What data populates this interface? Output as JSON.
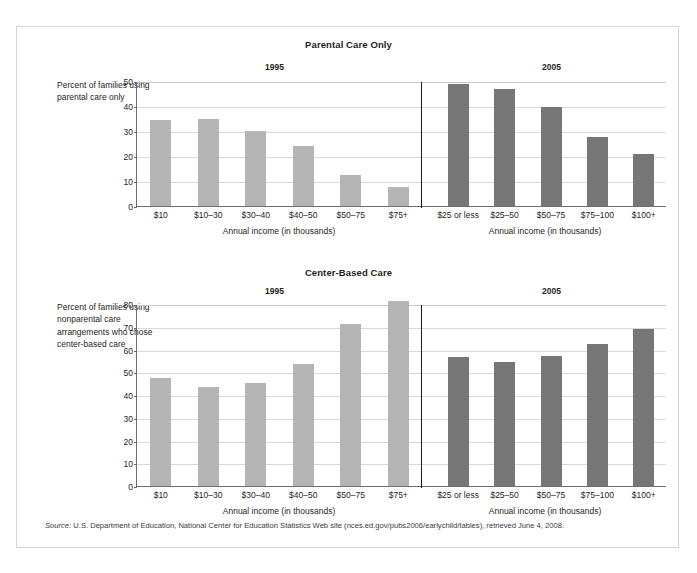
{
  "source_note_prefix": "Source:",
  "source_note": " U.S. Department of Education, National Center for Education Statistics Web site (nces.ed.gov/pubs2006/earlychild/tables), retrieved June 4, 2008.",
  "colors": {
    "bar_1995": "#b4b4b4",
    "bar_2005": "#767676",
    "axis": "#6d6d6d",
    "gridline": "#d9d9d9",
    "divider": "#1a1a1a",
    "frame": "#d4d4d4",
    "text": "#231f20"
  },
  "chart_data": [
    {
      "type": "bar",
      "title": "Parental Care Only",
      "ylabel": "Percent of families using parental care only",
      "ylim": [
        0,
        50
      ],
      "yticks": [
        0,
        10,
        20,
        30,
        40,
        50
      ],
      "grid": true,
      "legend": "none",
      "panels": [
        {
          "name": "1995",
          "xlabel": "Annual income (in thousands)",
          "categories": [
            "$10",
            "$10–30",
            "$30–40",
            "$40–50",
            "$50–75",
            "$75+"
          ],
          "values": [
            34.3,
            35.0,
            30.0,
            24.0,
            12.5,
            7.5
          ]
        },
        {
          "name": "2005",
          "xlabel": "Annual income (in thousands)",
          "categories": [
            "$25 or less",
            "$25–50",
            "$50–75",
            "$75–100",
            "$100+"
          ],
          "values": [
            49.0,
            47.0,
            39.5,
            27.5,
            21.0
          ]
        }
      ]
    },
    {
      "type": "bar",
      "title": "Center-Based Care",
      "ylabel": "Percent of families using nonparental care arrangements who chose center-based care",
      "ylim": [
        0,
        80
      ],
      "yticks": [
        0,
        10,
        20,
        30,
        40,
        50,
        60,
        70,
        80
      ],
      "grid": true,
      "legend": "none",
      "panels": [
        {
          "name": "1995",
          "xlabel": "Annual income (in thousands)",
          "categories": [
            "$10",
            "$10–30",
            "$30–40",
            "$40–50",
            "$50–75",
            "$75+"
          ],
          "values": [
            47.5,
            43.5,
            45.5,
            53.5,
            71.0,
            81.5
          ]
        },
        {
          "name": "2005",
          "xlabel": "Annual income (in thousands)",
          "categories": [
            "$25 or less",
            "$25–50",
            "$50–75",
            "$75–100",
            "$100+"
          ],
          "values": [
            56.5,
            54.5,
            57.0,
            62.5,
            69.0
          ]
        }
      ]
    }
  ]
}
